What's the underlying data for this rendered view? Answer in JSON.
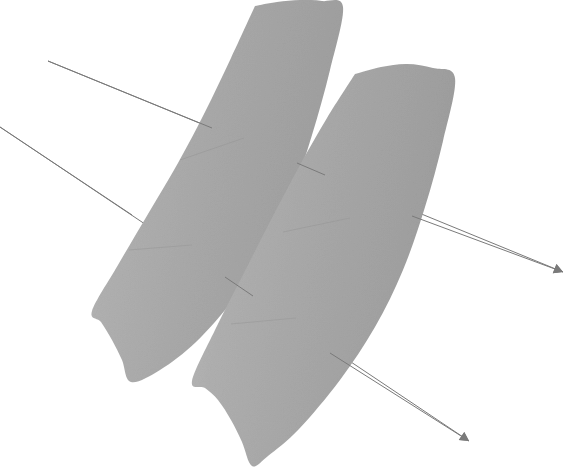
{
  "figure": {
    "background_color": "#ffffff",
    "width": 569,
    "height": 472
  },
  "chart_data": {
    "type": "scatter",
    "title": "",
    "xlabel": "",
    "ylabel": "",
    "grid": false,
    "legend_position": "none",
    "xlim": [
      0,
      569
    ],
    "ylim": [
      0,
      472
    ],
    "note": "Geometric illustration; coordinates are pixel positions in the image frame with y increasing downward.",
    "series": [
      {
        "name": "ribbon-left",
        "kind": "filled-band",
        "fill_color": "#aaaaaa",
        "leading_edge": [
          [
            255,
            6
          ],
          [
            277,
            2
          ],
          [
            300,
            0
          ],
          [
            322,
            1
          ],
          [
            343,
            7
          ]
        ],
        "right_boundary": [
          [
            343,
            7
          ],
          [
            330,
            70
          ],
          [
            312,
            135
          ],
          [
            291,
            197
          ],
          [
            265,
            252
          ],
          [
            233,
            300
          ],
          [
            196,
            342
          ],
          [
            160,
            370
          ],
          [
            131,
            382
          ]
        ],
        "trailing_edge": [
          [
            131,
            382
          ],
          [
            122,
            360
          ],
          [
            112,
            340
          ],
          [
            101,
            322
          ],
          [
            92,
            311
          ]
        ],
        "left_boundary": [
          [
            92,
            311
          ],
          [
            118,
            265
          ],
          [
            148,
            214
          ],
          [
            178,
            163
          ],
          [
            205,
            112
          ],
          [
            231,
            58
          ],
          [
            255,
            6
          ]
        ]
      },
      {
        "name": "ribbon-right",
        "kind": "filled-band",
        "fill_color": "#aaaaaa",
        "leading_edge": [
          [
            355,
            74
          ],
          [
            381,
            67
          ],
          [
            407,
            64
          ],
          [
            433,
            68
          ],
          [
            455,
            78
          ]
        ],
        "right_boundary": [
          [
            455,
            78
          ],
          [
            443,
            141
          ],
          [
            425,
            207
          ],
          [
            403,
            270
          ],
          [
            375,
            327
          ],
          [
            340,
            380
          ],
          [
            299,
            429
          ],
          [
            268,
            456
          ],
          [
            252,
            466
          ]
        ],
        "trailing_edge": [
          [
            252,
            466
          ],
          [
            242,
            442
          ],
          [
            231,
            420
          ],
          [
            218,
            400
          ],
          [
            205,
            388
          ],
          [
            192,
            381
          ]
        ],
        "left_boundary": [
          [
            192,
            381
          ],
          [
            215,
            330
          ],
          [
            243,
            275
          ],
          [
            271,
            220
          ],
          [
            299,
            167
          ],
          [
            327,
            118
          ],
          [
            355,
            74
          ]
        ]
      },
      {
        "name": "axis-arrow-upper",
        "kind": "directed-line",
        "stroke_color": "#7a7a7a",
        "stroke_width": 1,
        "start": [
          48,
          61
        ],
        "end": [
          563,
          272
        ],
        "arrowhead": "triangle",
        "arrowhead_at": "end",
        "arrowhead_size": 9
      },
      {
        "name": "axis-arrow-lower",
        "kind": "directed-line",
        "stroke_color": "#7a7a7a",
        "stroke_width": 1,
        "start": [
          0,
          127
        ],
        "end": [
          469,
          441
        ],
        "arrowhead": "triangle",
        "arrowhead_at": "end",
        "arrowhead_size": 9
      },
      {
        "name": "seam-left-upper",
        "kind": "seam",
        "stroke_color": "#9a9a9a",
        "points": [
          [
            180,
            160
          ],
          [
            244,
            138
          ]
        ]
      },
      {
        "name": "seam-left-lower",
        "kind": "seam",
        "stroke_color": "#9a9a9a",
        "points": [
          [
            129,
            250
          ],
          [
            192,
            245
          ]
        ]
      },
      {
        "name": "seam-right-upper",
        "kind": "seam",
        "stroke_color": "#9a9a9a",
        "points": [
          [
            283,
            232
          ],
          [
            350,
            218
          ]
        ]
      },
      {
        "name": "seam-right-lower",
        "kind": "seam",
        "stroke_color": "#9a9a9a",
        "points": [
          [
            231,
            324
          ],
          [
            296,
            318
          ]
        ]
      }
    ]
  },
  "colors": {
    "ribbon_fill": "#aaaaaa",
    "ribbon_fill_light": "#b4b4b4",
    "ribbon_fill_dark": "#9e9e9e",
    "line_stroke": "#7a7a7a",
    "seam_stroke": "#9a9a9a",
    "background": "#ffffff"
  },
  "labels": {
    "ribbon_left": "left ribbon surface",
    "ribbon_right": "right ribbon surface",
    "arrow_upper": "upper direction arrow",
    "arrow_lower": "lower direction arrow"
  }
}
